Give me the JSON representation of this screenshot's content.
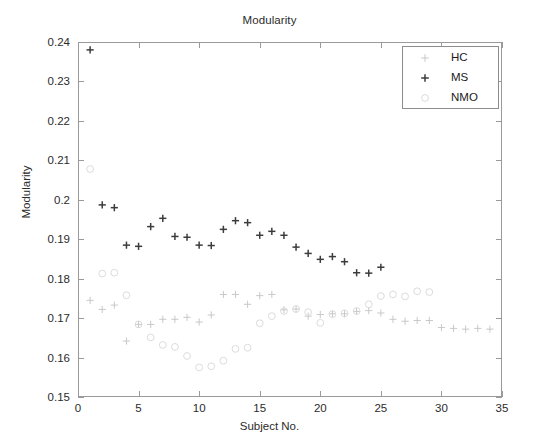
{
  "figure": {
    "title": "Modularity",
    "xlabel": "Subject No.",
    "ylabel": "Modularity"
  },
  "legend": {
    "position": "top-right",
    "entries": [
      {
        "label": "HC",
        "marker": "plus",
        "color": "#c8c8c8"
      },
      {
        "label": "MS",
        "marker": "plus",
        "color": "#3c3c3c"
      },
      {
        "label": "NMO",
        "marker": "circle",
        "color": "#dcdcdc"
      }
    ]
  },
  "axis": {
    "x_ticks": [
      "0",
      "5",
      "10",
      "15",
      "20",
      "25",
      "30",
      "35"
    ],
    "y_ticks": [
      "0.15",
      "0.16",
      "0.17",
      "0.18",
      "0.19",
      "0.2",
      "0.21",
      "0.22",
      "0.23",
      "0.24"
    ]
  },
  "chart_data": {
    "type": "scatter",
    "title": "Modularity",
    "xlabel": "Subject No.",
    "ylabel": "Modularity",
    "xlim": [
      0,
      35
    ],
    "ylim": [
      0.15,
      0.24
    ],
    "xticks": [
      0,
      5,
      10,
      15,
      20,
      25,
      30,
      35
    ],
    "yticks": [
      0.15,
      0.16,
      0.17,
      0.18,
      0.19,
      0.2,
      0.21,
      0.22,
      0.23,
      0.24
    ],
    "grid": false,
    "legend_position": "upper right",
    "series": [
      {
        "name": "HC",
        "marker": "plus",
        "color": "#c8c8c8",
        "x": [
          1,
          2,
          3,
          4,
          5,
          6,
          7,
          8,
          9,
          10,
          11,
          12,
          13,
          14,
          15,
          16,
          17,
          18,
          19,
          20,
          21,
          22,
          23,
          24,
          25,
          26,
          27,
          28,
          29,
          30,
          31,
          32,
          33,
          34
        ],
        "y": [
          0.1745,
          0.1722,
          0.1733,
          0.1642,
          0.1684,
          0.1684,
          0.1697,
          0.1697,
          0.1702,
          0.169,
          0.1708,
          0.176,
          0.176,
          0.1735,
          0.1757,
          0.176,
          0.1721,
          0.1723,
          0.1705,
          0.1709,
          0.1711,
          0.1711,
          0.1717,
          0.1719,
          0.1713,
          0.1697,
          0.1692,
          0.1694,
          0.1694,
          0.1676,
          0.1674,
          0.1672,
          0.1674,
          0.1672
        ]
      },
      {
        "name": "MS",
        "marker": "plus",
        "color": "#3c3c3c",
        "x": [
          1,
          2,
          3,
          4,
          5,
          6,
          7,
          8,
          9,
          10,
          11,
          12,
          13,
          14,
          15,
          16,
          17,
          18,
          19,
          20,
          21,
          22,
          23,
          24,
          25
        ],
        "y": [
          0.238,
          0.1987,
          0.198,
          0.1885,
          0.1882,
          0.1932,
          0.1953,
          0.1907,
          0.1905,
          0.1885,
          0.1884,
          0.1925,
          0.1947,
          0.1942,
          0.191,
          0.192,
          0.191,
          0.188,
          0.1864,
          0.1849,
          0.1856,
          0.1843,
          0.1815,
          0.1814,
          0.1829
        ]
      },
      {
        "name": "NMO",
        "marker": "circle",
        "color": "#dcdcdc",
        "x": [
          1,
          2,
          3,
          4,
          5,
          6,
          7,
          8,
          9,
          10,
          11,
          12,
          13,
          14,
          15,
          16,
          17,
          18,
          19,
          20,
          21,
          22,
          23,
          24,
          25,
          26,
          27,
          28,
          29
        ],
        "y": [
          0.2078,
          0.1813,
          0.1815,
          0.1758,
          0.1684,
          0.1651,
          0.1632,
          0.1627,
          0.1604,
          0.1575,
          0.1578,
          0.1592,
          0.1622,
          0.1625,
          0.1687,
          0.1705,
          0.1718,
          0.1723,
          0.1715,
          0.1688,
          0.171,
          0.1712,
          0.1718,
          0.1735,
          0.1756,
          0.176,
          0.1755,
          0.1768,
          0.1766
        ]
      }
    ]
  }
}
